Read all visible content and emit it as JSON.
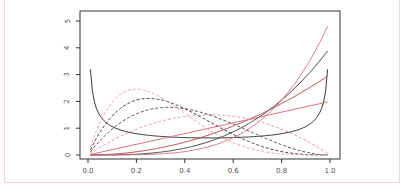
{
  "chart_data": {
    "type": "line",
    "title": "",
    "xlabel": "",
    "ylabel": "",
    "xlim": [
      0,
      1
    ],
    "ylim": [
      0,
      5
    ],
    "grid": false,
    "legend": null,
    "x_ticks": [
      "0.0",
      "0.2",
      "0.4",
      "0.6",
      "0.8",
      "1.0"
    ],
    "y_ticks": [
      "0",
      "1",
      "2",
      "3",
      "4",
      "5"
    ],
    "x_range_plotted": [
      0.01,
      0.99
    ],
    "series": [
      {
        "name": "Beta(0.5,0.5)",
        "dist": "beta",
        "a": 0.5,
        "b": 0.5,
        "style": "solid",
        "color": "#3a3a3a",
        "start_value": 3.2,
        "end_value": 3.2
      },
      {
        "name": "Beta(2,1)",
        "dist": "beta",
        "a": 2,
        "b": 1,
        "style": "solid",
        "color": "#e06a7a",
        "end_value": 2
      },
      {
        "name": "Beta(3,1)",
        "dist": "beta",
        "a": 3,
        "b": 1,
        "style": "solid",
        "color": "#c2505e",
        "end_value": 3
      },
      {
        "name": "Beta(4,1)",
        "dist": "beta",
        "a": 4,
        "b": 1,
        "style": "solid",
        "color": "#4a4a4a",
        "end_value": 4
      },
      {
        "name": "Beta(5,1)",
        "dist": "beta",
        "a": 5,
        "b": 1,
        "style": "solid",
        "color": "#e07a88",
        "end_value": 5
      },
      {
        "name": "Beta(2,2)",
        "dist": "beta",
        "a": 2,
        "b": 2,
        "style": "dashed",
        "color": "#e49aa4",
        "peak": [
          0.5,
          1.5
        ]
      },
      {
        "name": "Beta(2,3)",
        "dist": "beta",
        "a": 2,
        "b": 3,
        "style": "dashed",
        "color": "#555555",
        "peak": [
          0.33,
          1.78
        ]
      },
      {
        "name": "Beta(2,4)",
        "dist": "beta",
        "a": 2,
        "b": 4,
        "style": "dashed",
        "color": "#444444",
        "peak": [
          0.25,
          2.11
        ]
      },
      {
        "name": "Beta(2,5)",
        "dist": "beta",
        "a": 2,
        "b": 5,
        "style": "dashed",
        "color": "#eaa6ae",
        "peak": [
          0.2,
          2.46
        ]
      }
    ]
  },
  "layout": {
    "plot_box": {
      "left": 80,
      "top": 11,
      "right": 340,
      "bottom": 159
    },
    "x_origin_px": 88,
    "x_scale_px": 242,
    "y_origin_px": 155,
    "y_scale_px": 26.8
  }
}
